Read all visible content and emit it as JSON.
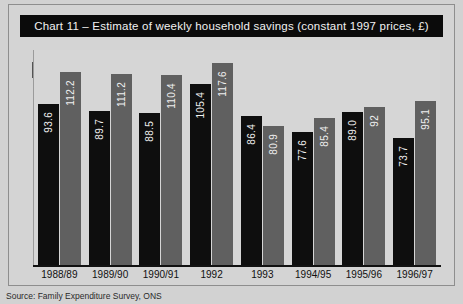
{
  "figure": {
    "title": "Chart 11 – Estimate of weekly household savings (constant 1997 prices, £)",
    "source_note": "Source: Family Expenditure Survey, ONS",
    "badge_icon": "info-badge-icon",
    "colors": {
      "scotland": "#0e0e0e",
      "uk": "#606060",
      "title_banner_bg": "#0b0b0b",
      "title_banner_text": "#f2f2f2",
      "plot_bg": "#d6d6d6",
      "page_bg": "#d2d2d2"
    }
  },
  "legend": {
    "position": "top-right",
    "items": [
      {
        "label": "Scotland",
        "color": "#0e0e0e"
      },
      {
        "label": "UK",
        "color": "#606060"
      }
    ]
  },
  "chart_data": {
    "type": "bar",
    "title": "Chart 11 – Estimate of weekly household savings (constant 1997 prices, £)",
    "xlabel": "",
    "ylabel": "",
    "ylim": [
      0,
      125
    ],
    "grid": false,
    "legend_position": "top-right",
    "categories": [
      "1988/89",
      "1989/90",
      "1990/91",
      "1992",
      "1993",
      "1994/95",
      "1995/96",
      "1996/97"
    ],
    "series": [
      {
        "name": "Scotland",
        "color": "#0e0e0e",
        "values": [
          93.6,
          89.7,
          88.5,
          105.4,
          86.4,
          77.6,
          89.0,
          73.7
        ],
        "labels": [
          "93.6",
          "89.7",
          "88.5",
          "105.4",
          "86.4",
          "77.6",
          "89.0",
          "73.7"
        ]
      },
      {
        "name": "UK",
        "color": "#606060",
        "values": [
          112.2,
          111.2,
          110.4,
          117.6,
          80.9,
          85.4,
          92.0,
          95.1
        ],
        "labels": [
          "112.2",
          "111.2",
          "110.4",
          "117.6",
          "80.9",
          "85.4",
          "92",
          "95.1"
        ]
      }
    ]
  }
}
